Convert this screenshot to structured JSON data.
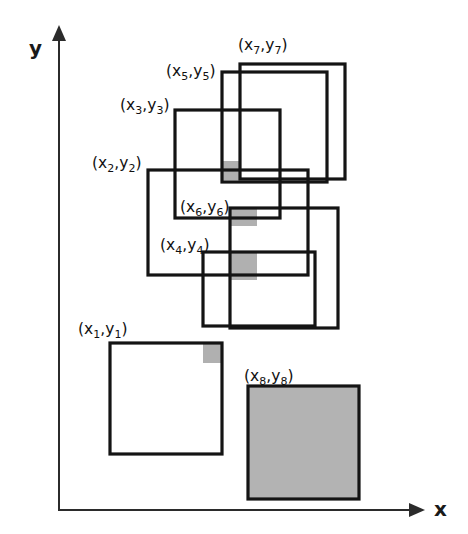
{
  "figure": {
    "background_color": "#ffffff",
    "outline_color": "#141414",
    "fill_color": "#b3b3b3",
    "axis_color": "#2b2b2b"
  },
  "axes": {
    "x_label": "x",
    "y_label": "y",
    "origin": {
      "x": 59,
      "y": 510
    },
    "x_axis_end": {
      "x": 425,
      "y": 510
    },
    "y_axis_end": {
      "x": 59,
      "y": 25
    }
  },
  "chart_data": {
    "type": "diagram",
    "xlabel": "x",
    "ylabel": "y",
    "grid": false,
    "legend": "none",
    "shape_count": 8,
    "shapes": [
      {
        "id": 1,
        "label": "(x1,y1)",
        "label_x_text": "x",
        "label_sub": "1",
        "x": 110,
        "y": 343,
        "width": 112,
        "height": 111,
        "filled": false,
        "label_pos": {
          "x": 78,
          "y": 334
        },
        "anchor_corner": "top-left"
      },
      {
        "id": 2,
        "label": "(x2,y2)",
        "label_x_text": "x",
        "label_sub": "2",
        "x": 148,
        "y": 170,
        "width": 160,
        "height": 105,
        "filled": false,
        "label_pos": {
          "x": 92,
          "y": 168
        },
        "anchor_corner": "top-left"
      },
      {
        "id": 3,
        "label": "(x3,y3)",
        "label_x_text": "x",
        "label_sub": "3",
        "x": 175,
        "y": 110,
        "width": 105,
        "height": 108,
        "filled": false,
        "label_pos": {
          "x": 120,
          "y": 110
        },
        "anchor_corner": "top-left"
      },
      {
        "id": 4,
        "label": "(x4,y4)",
        "label_x_text": "x",
        "label_sub": "4",
        "x": 203,
        "y": 252,
        "width": 112,
        "height": 74,
        "filled": false,
        "label_pos": {
          "x": 160,
          "y": 250
        },
        "anchor_corner": "top-left"
      },
      {
        "id": 5,
        "label": "(x5,y5)",
        "label_x_text": "x",
        "label_sub": "5",
        "x": 222,
        "y": 72,
        "width": 105,
        "height": 110,
        "filled": false,
        "label_pos": {
          "x": 166,
          "y": 76
        },
        "anchor_corner": "top-left"
      },
      {
        "id": 6,
        "label": "(x6,y6)",
        "label_x_text": "x",
        "label_sub": "6",
        "x": 230,
        "y": 208,
        "width": 108,
        "height": 120,
        "filled": false,
        "label_pos": {
          "x": 180,
          "y": 212
        },
        "anchor_corner": "top-left"
      },
      {
        "id": 7,
        "label": "(x7,y7)",
        "label_x_text": "x",
        "label_sub": "7",
        "x": 240,
        "y": 64,
        "width": 105,
        "height": 115,
        "filled": false,
        "label_pos": {
          "x": 238,
          "y": 50
        },
        "anchor_corner": "top-left"
      },
      {
        "id": 8,
        "label": "(x8,y8)",
        "label_x_text": "x",
        "label_sub": "8",
        "x": 248,
        "y": 386,
        "width": 111,
        "height": 113,
        "filled": true,
        "label_pos": {
          "x": 244,
          "y": 381
        },
        "anchor_corner": "top-left"
      }
    ],
    "overlap_patches": [
      {
        "id": "patch-a",
        "x": 222,
        "y": 161,
        "width": 18,
        "height": 19
      },
      {
        "id": "patch-b",
        "x": 230,
        "y": 208,
        "width": 27,
        "height": 18
      },
      {
        "id": "patch-c",
        "x": 230,
        "y": 252,
        "width": 27,
        "height": 28
      },
      {
        "id": "patch-d",
        "x": 203,
        "y": 343,
        "width": 19,
        "height": 20
      }
    ]
  }
}
